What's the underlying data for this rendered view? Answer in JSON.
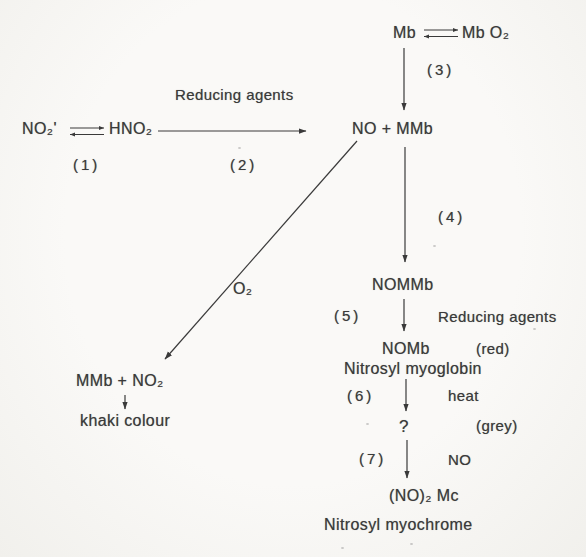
{
  "page": {
    "background_color": "#f7f6f3",
    "ink_color": "#3a3a3a"
  },
  "diagram": {
    "type": "reaction-scheme",
    "nodes": {
      "nitrite": "NO₂'",
      "nitrous_acid": "HNO₂",
      "mb": "Mb",
      "mb_o2": "Mb O₂",
      "no_mmb": "NO + MMb",
      "nommb": "NOMMb",
      "nomb": "NOMb",
      "nomb_colour": "(red)",
      "nomb_name": "Nitrosyl myoglobin",
      "unknown_intermediate": "?",
      "unknown_colour": "(grey)",
      "no2mc": "(NO)₂ Mc",
      "no2mc_name": "Nitrosyl myochrome",
      "mmb_no2": "MMb + NO₂",
      "khaki": "khaki colour"
    },
    "step_labels": {
      "s1": "(1)",
      "s2": "(2)",
      "s3": "(3)",
      "s4": "(4)",
      "s5": "(5)",
      "s6": "(6)",
      "s7": "(7)"
    },
    "edge_labels": {
      "reducing_agents_top": "Reducing agents",
      "reducing_agents_mid": "Reducing agents",
      "o2": "O₂",
      "heat": "heat",
      "no": "NO"
    },
    "edges": [
      {
        "from": "NO₂'",
        "to": "HNO₂",
        "type": "equilibrium",
        "step": "(1)"
      },
      {
        "from": "HNO₂",
        "to": "NO + MMb",
        "label": "Reducing agents",
        "step": "(2)"
      },
      {
        "from": "Mb",
        "to": "Mb O₂",
        "type": "equilibrium"
      },
      {
        "from": "Mb ⇌ Mb O₂",
        "to": "NO + MMb",
        "step": "(3)"
      },
      {
        "from": "NO + MMb",
        "to": "NOMMb",
        "step": "(4)"
      },
      {
        "from": "NOMMb",
        "to": "NOMb",
        "label": "Reducing agents",
        "step": "(5)"
      },
      {
        "from": "NOMb",
        "to": "?",
        "label": "heat",
        "step": "(6)"
      },
      {
        "from": "?",
        "to": "(NO)₂ Mc",
        "label": "NO",
        "step": "(7)"
      },
      {
        "from": "NO + MMb",
        "to": "MMb + NO₂",
        "label": "O₂"
      },
      {
        "from": "MMb + NO₂",
        "to": "khaki colour"
      }
    ]
  }
}
